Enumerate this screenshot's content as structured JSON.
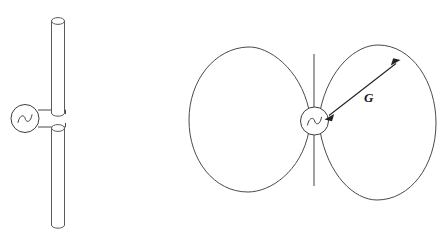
{
  "figure": {
    "background_color": "#ffffff",
    "line_color": "#4a4a4a",
    "label_color": "#1a1a1a",
    "width": 441,
    "height": 240
  },
  "left_diagram": {
    "name": "dipole-antenna-schematic",
    "description": "Vertical dipole antenna: two cylindrical rods fed at the center by an AC source",
    "source": {
      "symbol": "ac-source",
      "glyph": "sine-wave",
      "center_x": 26,
      "center_y": 118,
      "radius": 14
    },
    "upper_rod": {
      "label": "upper-dipole-element",
      "x": 58,
      "top_y": 17,
      "bottom_y": 113,
      "width": 14
    },
    "lower_rod": {
      "label": "lower-dipole-element",
      "x": 58,
      "top_y": 124,
      "bottom_y": 228,
      "width": 14
    },
    "feed_wires": [
      {
        "label": "upper-feed-wire",
        "from_x": 40,
        "from_y": 110,
        "to_x": 65,
        "to_y": 110
      },
      {
        "label": "lower-feed-wire",
        "from_x": 40,
        "from_y": 127,
        "to_x": 65,
        "to_y": 127
      }
    ]
  },
  "right_diagram": {
    "name": "radiation-pattern",
    "description": "Two-lobe (doughnut cross-section) radiation pattern of the dipole",
    "source": {
      "symbol": "ac-source",
      "glyph": "sine-wave",
      "center_x": 314,
      "center_y": 121,
      "radius": 14
    },
    "antenna_axis": {
      "label": "antenna-axis-line",
      "x": 314,
      "top_y": 54,
      "bottom_y": 186
    },
    "left_lobe": {
      "label": "left-radiation-lobe",
      "center_x": 251,
      "center_y": 120,
      "rx": 62,
      "ry": 73
    },
    "right_lobe": {
      "label": "right-radiation-lobe",
      "center_x": 376,
      "center_y": 122,
      "rx": 61,
      "ry": 77
    },
    "gain_arrow": {
      "label": "gain-double-arrow",
      "tail_x": 326,
      "tail_y": 118,
      "head_x": 399,
      "head_y": 61,
      "double_headed": true
    },
    "gain_label": {
      "text": "G",
      "x": 368,
      "y": 101,
      "style": "italic"
    }
  }
}
